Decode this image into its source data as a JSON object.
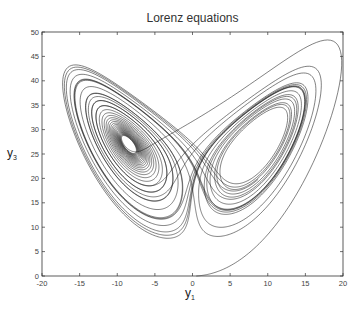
{
  "chart_data": {
    "type": "line",
    "title": "Lorenz equations",
    "xlabel": "y1",
    "ylabel": "y3",
    "xlabel_main": "y",
    "xlabel_sub": "1",
    "ylabel_main": "y",
    "ylabel_sub": "3",
    "xlim": [
      -20,
      20
    ],
    "ylim": [
      0,
      50
    ],
    "xticks": [
      -20,
      -15,
      -10,
      -5,
      0,
      5,
      10,
      15,
      20
    ],
    "yticks": [
      0,
      5,
      10,
      15,
      20,
      25,
      30,
      35,
      40,
      45,
      50
    ],
    "grid": false,
    "legend": null,
    "series": [
      {
        "name": "Lorenz trajectory (y1 vs y3)",
        "color": "#1a1a1a",
        "generator": {
          "system": "lorenz",
          "sigma": 10,
          "rho": 28,
          "beta": 2.6666667,
          "initial": [
            0.5,
            1.0,
            0.0
          ],
          "dt": 0.004,
          "steps": 9000
        },
        "approx_points": [
          [
            0.5,
            0
          ],
          [
            5,
            4
          ],
          [
            12,
            14
          ],
          [
            18,
            30
          ],
          [
            20,
            46
          ],
          [
            17,
            48.5
          ],
          [
            5,
            40
          ],
          [
            -5,
            30
          ],
          [
            -15,
            40
          ],
          [
            -18,
            35
          ],
          [
            -10,
            20
          ],
          [
            -3,
            8
          ],
          [
            -2,
            15
          ],
          [
            -8,
            27
          ]
        ]
      }
    ],
    "annotations": [
      {
        "text": "dense spiral core",
        "x": -8.5,
        "y": 27
      }
    ]
  },
  "title": "Lorenz equations",
  "axes": {
    "x_ticks": [
      "-20",
      "-15",
      "-10",
      "-5",
      "0",
      "5",
      "10",
      "15",
      "20"
    ],
    "y_ticks": [
      "0",
      "5",
      "10",
      "15",
      "20",
      "25",
      "30",
      "35",
      "40",
      "45",
      "50"
    ]
  }
}
